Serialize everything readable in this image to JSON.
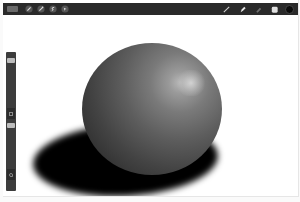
{
  "app": "Procreate-style drawing app",
  "toolbar": {
    "left": [
      {
        "name": "gallery",
        "icon": "gallery-icon"
      },
      {
        "name": "actions",
        "icon": "wrench-icon"
      },
      {
        "name": "adjustments",
        "icon": "magic-wand-icon"
      },
      {
        "name": "selection",
        "icon": "selection-s-icon"
      },
      {
        "name": "transform",
        "icon": "arrow-cursor-icon"
      }
    ],
    "right": [
      {
        "name": "brush",
        "icon": "brush-icon"
      },
      {
        "name": "smudge",
        "icon": "smudge-icon"
      },
      {
        "name": "eraser",
        "icon": "eraser-icon"
      },
      {
        "name": "layers",
        "icon": "layers-icon"
      },
      {
        "name": "color",
        "icon": "color-swatch",
        "value": "#0a0a0a"
      }
    ]
  },
  "sidebar": {
    "brush_size_slider": {
      "position": "top"
    },
    "modify_button": {
      "icon": "square-icon"
    },
    "opacity_slider": {
      "position": "middle"
    },
    "undo_button": {
      "icon": "undo-icon"
    }
  },
  "canvas": {
    "subject": "shaded sphere with cast shadow",
    "colors": {
      "sphere_light": "#b8b8b8",
      "sphere_dark": "#1e1e1e",
      "shadow": "#000000",
      "background": "#ffffff"
    }
  }
}
